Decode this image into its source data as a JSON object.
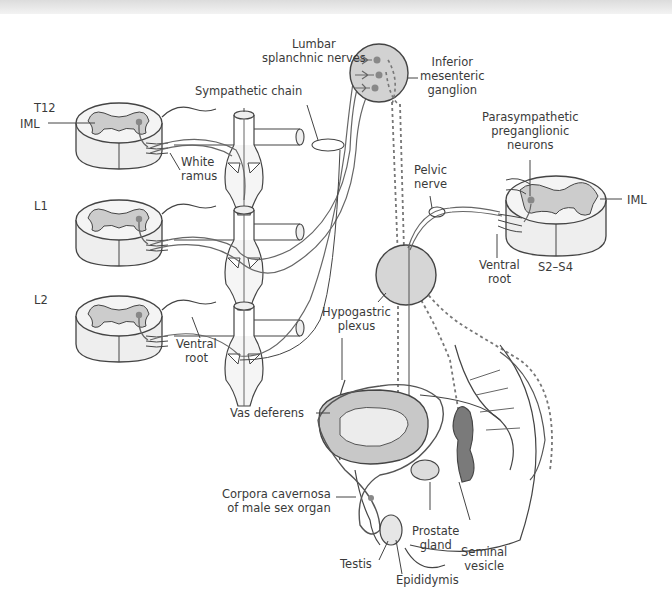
{
  "figure": {
    "colors": {
      "stroke": "#444444",
      "gray_matter": "#cccccc",
      "cord_white": "#eeeeee",
      "ganglion_fill": "#d2d2d2",
      "organ_dark": "#7a7a7a",
      "organ_mid": "#bdbdbd",
      "nerve_fiber": "#6e6e6e"
    }
  },
  "labels": {
    "t12": "T12",
    "l1": "L1",
    "l2": "L2",
    "iml_left": "IML",
    "iml_right": "IML",
    "sympathetic_chain": "Sympathetic chain",
    "white_ramus": [
      "White",
      "ramus"
    ],
    "ventral_root_left": [
      "Ventral",
      "root"
    ],
    "lumbar_splanchnic": [
      "Lumbar",
      "splanchnic nerves"
    ],
    "inferior_mesenteric": [
      "Inferior",
      "mesenteric",
      "ganglion"
    ],
    "parasympathetic": [
      "Parasympathetic",
      "preganglionic",
      "neurons"
    ],
    "pelvic_nerve": [
      "Pelvic",
      "nerve"
    ],
    "ventral_root_right": [
      "Ventral",
      "root"
    ],
    "s2_s4": "S2–S4",
    "hypogastric": [
      "Hypogastric",
      "plexus"
    ],
    "vas_deferens": "Vas deferens",
    "corpora": [
      "Corpora cavernosa",
      "of male sex organ"
    ],
    "prostate": [
      "Prostate",
      "gland"
    ],
    "seminal": [
      "Seminal",
      "vesicle"
    ],
    "testis": "Testis",
    "epididymis": "Epididymis"
  }
}
